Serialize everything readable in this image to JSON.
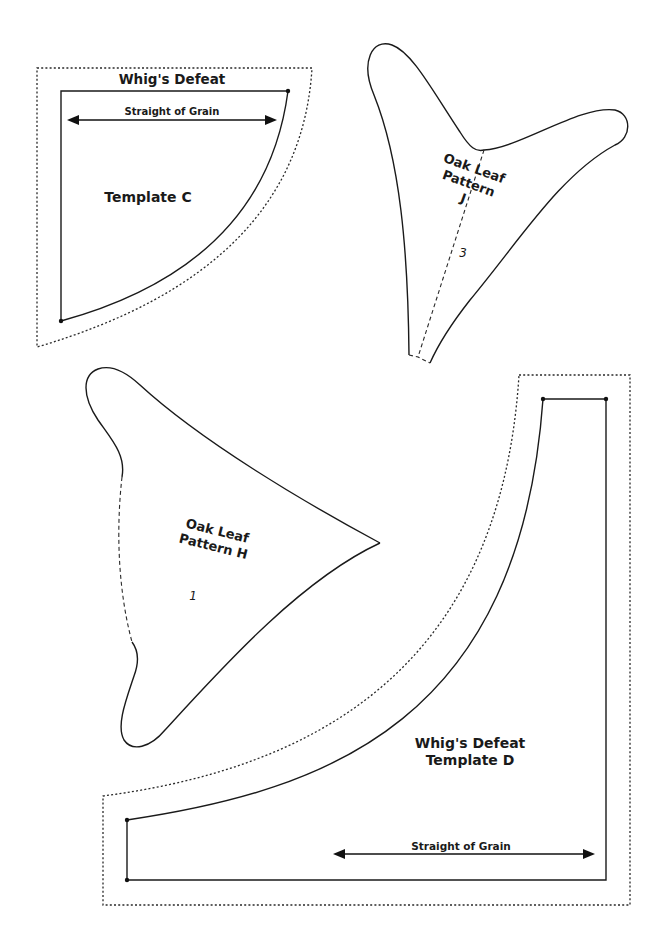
{
  "template_c": {
    "title": "Whig's Defeat",
    "name": "Template C",
    "grain_label": "Straight of Grain"
  },
  "pattern_j": {
    "line1": "Oak Leaf",
    "line2": "Pattern",
    "line3": "J",
    "piece_number": "3"
  },
  "pattern_h": {
    "line1": "Oak Leaf",
    "line2": "Pattern H",
    "piece_number": "1"
  },
  "template_d": {
    "title": "Whig's Defeat",
    "name": "Template D",
    "grain_label": "Straight of Grain"
  },
  "colors": {
    "line": "#1a1a1a",
    "background": "#ffffff"
  }
}
